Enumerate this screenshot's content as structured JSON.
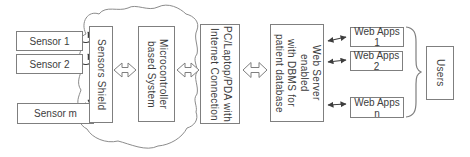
{
  "diagram": {
    "background": "#ffffff",
    "colors": {
      "box_border": "#7f7f7f",
      "text": "#3d3d3d",
      "open_arrow_outline": "#7f7f7f",
      "solid_arrow": "#3d3d3d",
      "cloud_outline": "#8c8c8c"
    },
    "nodes": {
      "sensor_1": {
        "label": "Sensor 1"
      },
      "sensor_2": {
        "label": "Sensor 2"
      },
      "sensor_m": {
        "label": "Sensor m"
      },
      "sensors_shield": {
        "label": "Sensors Shield"
      },
      "microcontroller": {
        "line1": "Microcontroller",
        "line2": "based System"
      },
      "pc": {
        "line1": "PC/Laptop/PDA with",
        "line2": "Internet Connection"
      },
      "web_server": {
        "line1": "Web Server enabled",
        "line2": "with DBMS for",
        "line3": "patient database"
      },
      "web_apps_1": {
        "label": "Web Apps 1"
      },
      "web_apps_2": {
        "label": "Web Apps 2"
      },
      "web_apps_n": {
        "label": "Web Apps n"
      },
      "users": {
        "label": "Users"
      }
    },
    "connectors": [
      {
        "from": "sensor_1",
        "to": "sensors_shield",
        "style": "curved-arrow"
      },
      {
        "from": "sensor_2",
        "to": "sensors_shield",
        "style": "curved-arrow"
      },
      {
        "from": "sensor_m",
        "to": "sensors_shield",
        "style": "curved-arrow"
      },
      {
        "from": "sensors_shield",
        "to": "microcontroller",
        "style": "open-double-arrow"
      },
      {
        "from": "microcontroller",
        "to": "pc",
        "style": "open-double-arrow"
      },
      {
        "from": "pc",
        "to": "web_server",
        "style": "open-double-arrow"
      },
      {
        "from": "web_server",
        "to": "web_apps_1",
        "style": "thin-double-arrow"
      },
      {
        "from": "web_server",
        "to": "web_apps_2",
        "style": "thin-double-arrow"
      },
      {
        "from": "web_server",
        "to": "web_apps_n",
        "style": "thin-double-arrow"
      },
      {
        "from": "web_apps_group",
        "to": "users",
        "style": "curly-brace"
      }
    ]
  }
}
